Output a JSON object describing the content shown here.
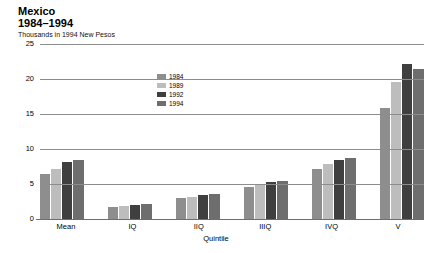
{
  "header": {
    "title_line1": "Mexico",
    "title_line2": "1984–1994",
    "subtitle": "Thousands in 1994 New Pesos"
  },
  "chart_data": {
    "type": "bar",
    "title": "Mexico 1984–1994",
    "subtitle": "Thousands in 1994 New Pesos",
    "xlabel": "Quintile",
    "ylabel": "",
    "ylim": [
      0,
      25
    ],
    "yticks": [
      0,
      5,
      10,
      15,
      20,
      25
    ],
    "ytick_labels": [
      "0",
      "5",
      "10",
      "15",
      "20",
      "25"
    ],
    "grid": true,
    "legend_position": "inside-top-center",
    "categories": [
      "Mean",
      "IQ",
      "IIQ",
      "IIIQ",
      "IVQ",
      "V"
    ],
    "series": [
      {
        "name": "1984",
        "color": "#8e8e8e",
        "values": [
          6.4,
          1.7,
          3.0,
          4.6,
          7.2,
          15.9
        ]
      },
      {
        "name": "1989",
        "color": "#bdbdbd",
        "values": [
          7.2,
          1.8,
          3.2,
          5.0,
          7.9,
          19.6
        ]
      },
      {
        "name": "1992",
        "color": "#3f3f3f",
        "values": [
          8.1,
          2.0,
          3.5,
          5.3,
          8.5,
          22.2
        ]
      },
      {
        "name": "1994",
        "color": "#6e6e6e",
        "values": [
          8.4,
          2.1,
          3.6,
          5.4,
          8.7,
          21.5
        ]
      }
    ]
  }
}
